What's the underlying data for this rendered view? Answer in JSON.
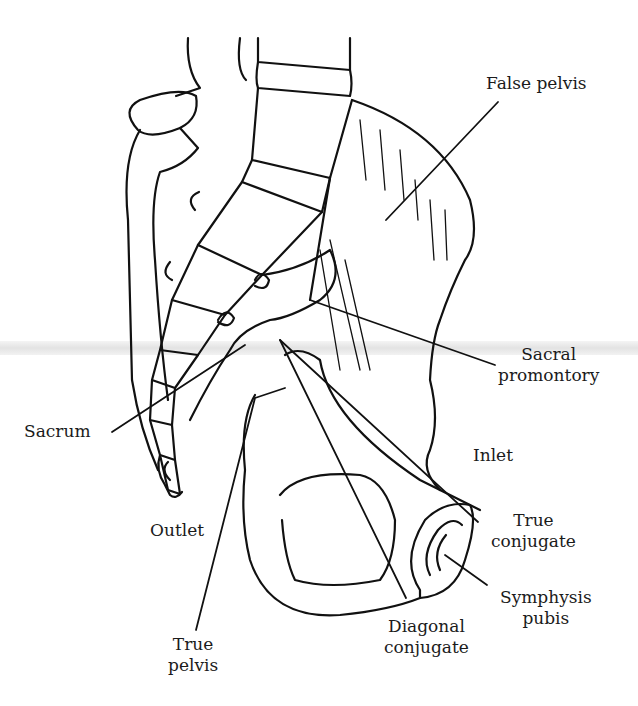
{
  "diagram": {
    "background": "#ffffff",
    "ink_color": "#111111",
    "labels": {
      "false_pelvis": {
        "line1": "False pelvis"
      },
      "sacral_promontory": {
        "line1": "Sacral",
        "line2": "promontory"
      },
      "sacrum": {
        "line1": "Sacrum"
      },
      "inlet": {
        "line1": "Inlet"
      },
      "outlet": {
        "line1": "Outlet"
      },
      "true_conjugate": {
        "line1": "True",
        "line2": "conjugate"
      },
      "symphysis_pubis": {
        "line1": "Symphysis",
        "line2": "pubis"
      },
      "true_pelvis": {
        "line1": "True",
        "line2": "pelvis"
      },
      "diagonal_conjugate": {
        "line1": "Diagonal",
        "line2": "conjugate"
      }
    }
  }
}
